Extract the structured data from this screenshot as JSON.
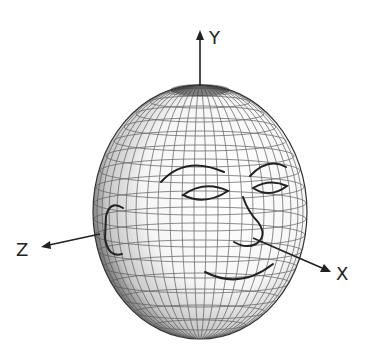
{
  "figure": {
    "type": "3d-head-model-with-axes"
  },
  "axes": {
    "x": {
      "label": "X"
    },
    "y": {
      "label": "Y"
    },
    "z": {
      "label": "Z"
    }
  },
  "face_features": [
    "left-eyebrow",
    "right-eyebrow",
    "left-eye",
    "right-eye",
    "nose",
    "mouth",
    "ear"
  ],
  "colors": {
    "stroke": "#222222",
    "grid": "#555555",
    "shade_dark": "#3a3a3a",
    "background": "#ffffff"
  }
}
